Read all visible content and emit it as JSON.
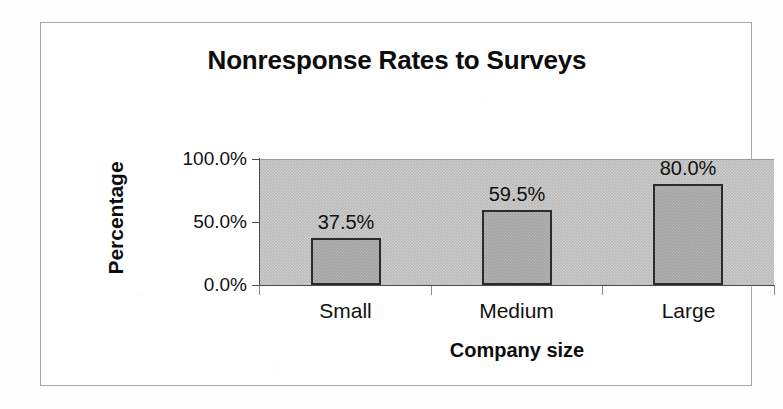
{
  "chart_data": {
    "type": "bar",
    "title": "Nonresponse Rates to Surveys",
    "xlabel": "Company size",
    "ylabel": "Percentage",
    "categories": [
      "Small",
      "Medium",
      "Large"
    ],
    "values": [
      37.5,
      59.5,
      80.0
    ],
    "data_labels": [
      "37.5%",
      "59.5%",
      "80.0%"
    ],
    "ytick_labels": [
      "100.0%",
      "50.0%",
      "0.0%"
    ],
    "ytick_values": [
      100,
      50,
      0
    ],
    "ylim": [
      0,
      100
    ],
    "grid": false,
    "legend": false,
    "legend_position": "none",
    "series": [
      {
        "name": "Nonresponse rate",
        "values": [
          37.5,
          59.5,
          80.0
        ]
      }
    ]
  },
  "style": {
    "plot_background": "#b9b9b9",
    "bar_fill": "#a2a2a2",
    "bar_border": "#2b2b2b",
    "frame_border": "#a9a9a9",
    "text_color": "#111111",
    "page_background": "#ffffff"
  }
}
